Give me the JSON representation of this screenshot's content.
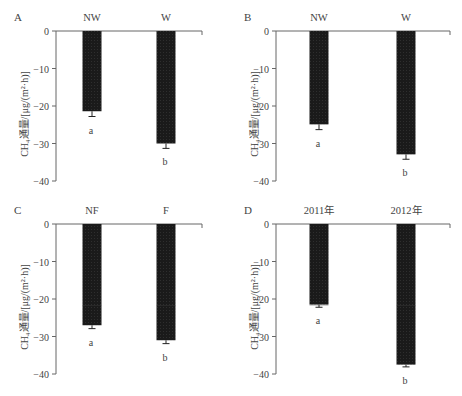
{
  "y_axis_label": "CH₄通量/[μg/(m²·h)]",
  "chart_data": [
    {
      "type": "bar",
      "panel": "A",
      "categories": [
        "NW",
        "W"
      ],
      "values": [
        -21.4,
        -30.0
      ],
      "errors": [
        1.4,
        1.3
      ],
      "letters": [
        "a",
        "b"
      ],
      "ylabel": "CH₄通量/[μg/(m²·h)]",
      "ylim": [
        -40,
        0
      ],
      "yticks": [
        0,
        -10,
        -20,
        -30,
        -40
      ],
      "ytick_labels": [
        "0",
        "−10",
        "−20",
        "−30",
        "−40"
      ],
      "bar_color": "#1a1a1a",
      "grid": false
    },
    {
      "type": "bar",
      "panel": "B",
      "categories": [
        "NW",
        "W"
      ],
      "values": [
        -24.9,
        -32.9
      ],
      "errors": [
        1.4,
        1.3
      ],
      "letters": [
        "a",
        "b"
      ],
      "ylabel": "CH₄通量/[μg/(m²·h)]",
      "ylim": [
        -40,
        0
      ],
      "yticks": [
        0,
        -10,
        -20,
        -30,
        -40
      ],
      "ytick_labels": [
        "0",
        "−10",
        "−20",
        "−30",
        "−40"
      ],
      "bar_color": "#1a1a1a",
      "grid": false
    },
    {
      "type": "bar",
      "panel": "C",
      "categories": [
        "NF",
        "F"
      ],
      "values": [
        -27.0,
        -31.0
      ],
      "errors": [
        0.9,
        0.9
      ],
      "letters": [
        "a",
        "b"
      ],
      "ylabel": "CH₄通量/[μg/(m²·h)]",
      "ylim": [
        -40,
        0
      ],
      "yticks": [
        0,
        -10,
        -20,
        -30,
        -40
      ],
      "ytick_labels": [
        "0",
        "−10",
        "−20",
        "−30",
        "−40"
      ],
      "bar_color": "#1a1a1a",
      "grid": false
    },
    {
      "type": "bar",
      "panel": "D",
      "categories": [
        "2011年",
        "2012年"
      ],
      "values": [
        -21.5,
        -37.5
      ],
      "errors": [
        0.7,
        0.6
      ],
      "letters": [
        "a",
        "b"
      ],
      "ylabel": "CH₄通量/[μg/(m²·h)]",
      "ylim": [
        -40,
        0
      ],
      "yticks": [
        0,
        -10,
        -20,
        -30,
        -40
      ],
      "ytick_labels": [
        "0",
        "−10",
        "−20",
        "−30",
        "−40"
      ],
      "bar_color": "#1a1a1a",
      "grid": false
    }
  ]
}
